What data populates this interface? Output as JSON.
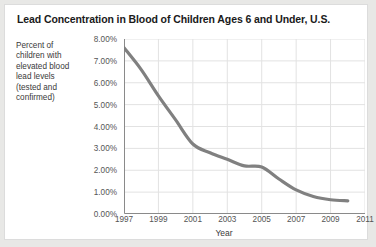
{
  "chart_data": {
    "type": "line",
    "title": "Lead Concentration in Blood of Children Ages 6 and Under, U.S.",
    "xlabel": "Year",
    "ylabel_lines": [
      "Percent of",
      "children with",
      "elevated blood",
      "lead levels",
      "(tested and",
      "confirmed)"
    ],
    "ylabel": "Percent of children with elevated blood lead levels (tested and confirmed)",
    "x": [
      1997,
      1998,
      1999,
      2000,
      2001,
      2002,
      2003,
      2004,
      2005,
      2006,
      2007,
      2008,
      2009,
      2010
    ],
    "values": [
      7.6,
      6.6,
      5.4,
      4.3,
      3.2,
      2.8,
      2.5,
      2.2,
      2.15,
      1.6,
      1.1,
      0.8,
      0.65,
      0.6
    ],
    "series": [
      {
        "name": "Percent of children with elevated blood lead levels",
        "values": [
          7.6,
          6.6,
          5.4,
          4.3,
          3.2,
          2.8,
          2.5,
          2.2,
          2.15,
          1.6,
          1.1,
          0.8,
          0.65,
          0.6
        ]
      }
    ],
    "xlim": [
      1997,
      2011
    ],
    "ylim": [
      0,
      8
    ],
    "y_ticks": [
      0,
      1,
      2,
      3,
      4,
      5,
      6,
      7,
      8
    ],
    "y_tick_labels": [
      "0.00%",
      "1.00%",
      "2.00%",
      "3.00%",
      "4.00%",
      "5.00%",
      "6.00%",
      "7.00%",
      "8.00%"
    ],
    "x_ticks": [
      1997,
      1999,
      2001,
      2003,
      2005,
      2007,
      2009,
      2011
    ],
    "x_tick_labels": [
      "1997",
      "1999",
      "2001",
      "2003",
      "2005",
      "2007",
      "2009",
      "2011"
    ],
    "grid": true,
    "legend": false,
    "line_color": "#808080",
    "grid_color": "#e2e2e2",
    "axis_color": "#8a8a8a",
    "background": "#ffffff"
  }
}
